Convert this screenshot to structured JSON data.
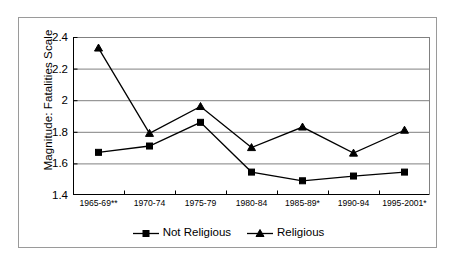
{
  "chart_data": {
    "type": "line",
    "title": "",
    "xlabel": "",
    "ylabel": "Magnitude: Fatalities Scale",
    "categories": [
      "1965-69**",
      "1970-74",
      "1975-79",
      "1980-84",
      "1985-89*",
      "1990-94",
      "1995-2001*"
    ],
    "series": [
      {
        "name": "Not Religious",
        "marker": "square",
        "color": "#000000",
        "values": [
          1.67,
          1.71,
          1.86,
          1.545,
          1.49,
          1.52,
          1.545
        ]
      },
      {
        "name": "Religious",
        "marker": "triangle",
        "color": "#000000",
        "values": [
          2.33,
          1.79,
          1.96,
          1.7,
          1.83,
          1.665,
          1.81
        ]
      }
    ],
    "ylim": [
      1.4,
      2.4
    ],
    "yticks": [
      1.4,
      1.6,
      1.8,
      2.0,
      2.2,
      2.4
    ],
    "ytick_labels": [
      "1.4",
      "1.6",
      "1.8",
      "2",
      "2.2",
      "2.4"
    ],
    "grid": "horizontal",
    "legend_position": "bottom-center",
    "plot_background": "#ffffff",
    "gridline_color": "#808080",
    "axis_color": "#000000",
    "frame_color": "#9a9a9a"
  },
  "legend": {
    "items": [
      {
        "label": "Not Religious",
        "marker": "square-marker"
      },
      {
        "label": "Religious",
        "marker": "triangle-marker"
      }
    ]
  }
}
